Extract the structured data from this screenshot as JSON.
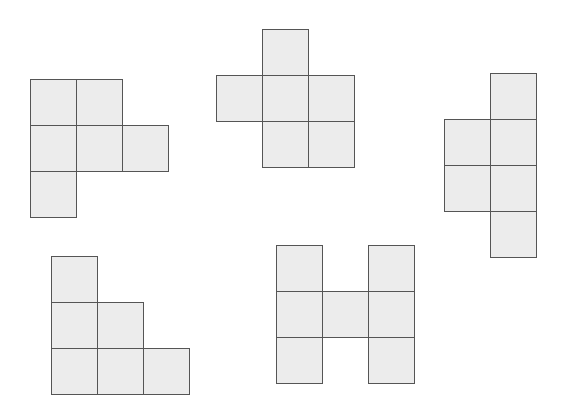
{
  "diagram": {
    "title": "",
    "cell_size": 46,
    "style": {
      "fill": "#ececec",
      "stroke": "#555555",
      "background": "#ffffff"
    },
    "shapes": [
      {
        "id": "shape-1",
        "origin": [
          30,
          79
        ],
        "cells": [
          [
            0,
            0
          ],
          [
            1,
            0
          ],
          [
            0,
            1
          ],
          [
            1,
            1
          ],
          [
            2,
            1
          ],
          [
            0,
            2
          ]
        ]
      },
      {
        "id": "shape-2",
        "origin": [
          216,
          29
        ],
        "cells": [
          [
            1,
            0
          ],
          [
            0,
            1
          ],
          [
            1,
            1
          ],
          [
            2,
            1
          ],
          [
            1,
            2
          ],
          [
            2,
            2
          ]
        ]
      },
      {
        "id": "shape-3",
        "origin": [
          444,
          73
        ],
        "cells": [
          [
            1,
            0
          ],
          [
            0,
            1
          ],
          [
            1,
            1
          ],
          [
            0,
            2
          ],
          [
            1,
            2
          ],
          [
            1,
            3
          ]
        ]
      },
      {
        "id": "shape-4",
        "origin": [
          51,
          256
        ],
        "cells": [
          [
            0,
            0
          ],
          [
            0,
            1
          ],
          [
            1,
            1
          ],
          [
            0,
            2
          ],
          [
            1,
            2
          ],
          [
            2,
            2
          ]
        ]
      },
      {
        "id": "shape-5",
        "origin": [
          276,
          245
        ],
        "cells": [
          [
            0,
            0
          ],
          [
            2,
            0
          ],
          [
            0,
            1
          ],
          [
            1,
            1
          ],
          [
            2,
            1
          ],
          [
            0,
            2
          ],
          [
            2,
            2
          ]
        ]
      }
    ]
  }
}
